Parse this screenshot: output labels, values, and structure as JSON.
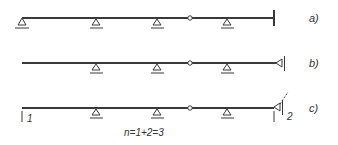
{
  "colors": {
    "line": "#3a3a3a",
    "text": "#333333",
    "background": "#ffffff"
  },
  "beams": [
    {
      "id": "a",
      "label": "a)",
      "end_condition": "fixed-wall"
    },
    {
      "id": "b",
      "label": "b)",
      "end_condition": "horizontal-roller-support"
    },
    {
      "id": "c",
      "label": "c)",
      "end_condition": "released-support-with-unknowns",
      "left_marker": "1",
      "right_marker": "2"
    }
  ],
  "caption": "n=1+2=3",
  "icons": [
    "pin-support-icon",
    "hinge-icon",
    "fixed-wall-icon",
    "horizontal-support-icon"
  ]
}
